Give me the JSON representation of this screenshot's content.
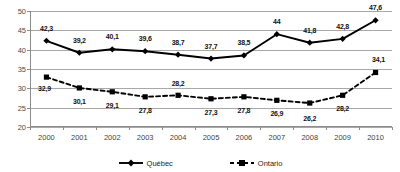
{
  "chart_data": {
    "type": "line",
    "title": "",
    "xlabel": "",
    "ylabel": "",
    "ylim": [
      20,
      50
    ],
    "ytick_values": [
      20,
      25,
      30,
      35,
      40,
      45,
      50
    ],
    "ytick_labels": [
      "20",
      "25",
      "30",
      "35",
      "40",
      "45",
      "50"
    ],
    "grid": true,
    "legend_position": "bottom",
    "categories": [
      "2000",
      "2001",
      "2002",
      "2003",
      "2004",
      "2005",
      "2006",
      "2007",
      "2008",
      "2009",
      "2010"
    ],
    "series": [
      {
        "name": "Québec",
        "marker": "diamond",
        "linestyle": "solid",
        "color": "#000000",
        "values": [
          42.3,
          39.2,
          40.1,
          39.6,
          38.7,
          37.7,
          38.5,
          44.0,
          41.8,
          42.8,
          47.6
        ],
        "labels": [
          "42,3",
          "39,2",
          "40,1",
          "39,6",
          "38,7",
          "37,7",
          "38,5",
          "44",
          "41,8",
          "42,8",
          "47,6"
        ],
        "label_offsets_px": [
          [
            0,
            -13
          ],
          [
            0,
            -13
          ],
          [
            0,
            -13
          ],
          [
            0,
            -13
          ],
          [
            0,
            -13
          ],
          [
            0,
            -13
          ],
          [
            0,
            -13
          ],
          [
            0,
            -13
          ],
          [
            0,
            -13
          ],
          [
            0,
            -13
          ],
          [
            0,
            -13
          ]
        ]
      },
      {
        "name": "Ontario",
        "marker": "square",
        "linestyle": "dashed",
        "color": "#000000",
        "values": [
          32.9,
          30.1,
          29.1,
          27.8,
          28.2,
          27.3,
          27.8,
          26.9,
          26.2,
          28.2,
          34.1
        ],
        "labels": [
          "32,9",
          "30,1",
          "29,1",
          "27,8",
          "28,2",
          "27,3",
          "27,8",
          "26,9",
          "26,2",
          "28,2",
          "34,1"
        ],
        "label_offsets_px": [
          [
            -2,
            11
          ],
          [
            0,
            13
          ],
          [
            0,
            13
          ],
          [
            0,
            13
          ],
          [
            0,
            -12
          ],
          [
            0,
            13
          ],
          [
            0,
            13
          ],
          [
            0,
            13
          ],
          [
            0,
            15
          ],
          [
            0,
            13
          ],
          [
            3,
            -13
          ]
        ]
      }
    ]
  },
  "legend": {
    "items": [
      {
        "label": "Québec",
        "marker": "diamond",
        "linestyle": "solid"
      },
      {
        "label": "Ontario",
        "marker": "square",
        "linestyle": "dashed"
      }
    ]
  }
}
